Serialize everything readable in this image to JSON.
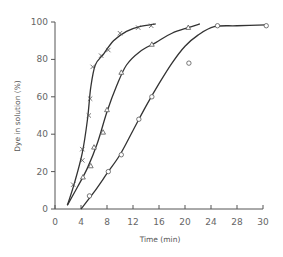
{
  "chart_data": {
    "type": "scatter",
    "title": "",
    "xlabel": "Time (min)",
    "ylabel": "Dye in solution (%)",
    "xticks": [
      "0",
      "4",
      "8",
      "12",
      "16",
      "20",
      "24",
      "28",
      "30"
    ],
    "yticks": [
      "0",
      "20",
      "40",
      "60",
      "80",
      "100"
    ],
    "xlim": [
      0,
      32
    ],
    "ylim": [
      0,
      100
    ],
    "grid": false,
    "legend": null,
    "series": [
      {
        "name": "cross",
        "marker": "x",
        "points": [
          [
            2.8,
            13
          ],
          [
            4.2,
            26
          ],
          [
            4.2,
            32
          ],
          [
            5.2,
            50
          ],
          [
            5.4,
            59
          ],
          [
            5.8,
            76
          ],
          [
            7.1,
            82
          ],
          [
            8.2,
            85
          ],
          [
            10.0,
            94
          ],
          [
            12.8,
            97
          ],
          [
            14.8,
            98
          ]
        ],
        "curve": [
          [
            1.9,
            2
          ],
          [
            3.0,
            14
          ],
          [
            4.2,
            30
          ],
          [
            5.0,
            48
          ],
          [
            5.5,
            65
          ],
          [
            6.2,
            77
          ],
          [
            7.5,
            83
          ],
          [
            9.0,
            90
          ],
          [
            11.0,
            95
          ],
          [
            13.0,
            97.5
          ],
          [
            15.5,
            99
          ]
        ]
      },
      {
        "name": "triangle",
        "marker": "triangle",
        "points": [
          [
            4.3,
            17
          ],
          [
            5.5,
            23
          ],
          [
            6.0,
            33
          ],
          [
            7.4,
            41
          ],
          [
            8.0,
            53
          ],
          [
            10.2,
            73
          ],
          [
            14.9,
            88
          ],
          [
            20.5,
            97
          ]
        ],
        "curve": [
          [
            1.9,
            2
          ],
          [
            3.5,
            12
          ],
          [
            5.0,
            22
          ],
          [
            6.5,
            35
          ],
          [
            8.0,
            52
          ],
          [
            9.5,
            66
          ],
          [
            11.0,
            77
          ],
          [
            13.0,
            84
          ],
          [
            15.5,
            89
          ],
          [
            18.0,
            94
          ],
          [
            20.5,
            97
          ],
          [
            22.3,
            99
          ]
        ]
      },
      {
        "name": "circle",
        "marker": "circle",
        "points": [
          [
            5.3,
            7
          ],
          [
            8.2,
            20
          ],
          [
            10.2,
            29
          ],
          [
            12.9,
            48
          ],
          [
            14.9,
            60
          ],
          [
            20.6,
            78
          ],
          [
            25.0,
            98
          ],
          [
            32.5,
            98
          ]
        ],
        "curve": [
          [
            4.0,
            0
          ],
          [
            6.0,
            9
          ],
          [
            8.0,
            19
          ],
          [
            10.0,
            29
          ],
          [
            12.0,
            42
          ],
          [
            14.0,
            55
          ],
          [
            16.0,
            67
          ],
          [
            18.0,
            78
          ],
          [
            20.0,
            87
          ],
          [
            22.0,
            93
          ],
          [
            24.5,
            97.5
          ],
          [
            28.0,
            98
          ],
          [
            32.5,
            98.5
          ]
        ]
      }
    ]
  }
}
